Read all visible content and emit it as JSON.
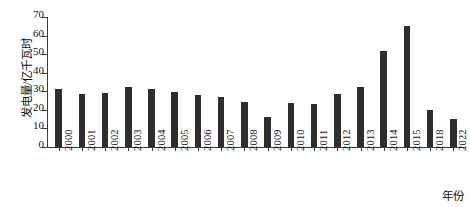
{
  "chart_data": {
    "type": "bar",
    "title": "",
    "xlabel": "年份",
    "ylabel": "发电量/亿千瓦时",
    "ylim": [
      0,
      70
    ],
    "yticks": [
      0,
      10,
      20,
      30,
      40,
      50,
      60,
      70
    ],
    "grid": false,
    "legend": null,
    "bar_color": "#2e2e2e",
    "axis_color": "#3a3a3a",
    "categories": [
      "2000",
      "2001",
      "2002",
      "2003",
      "2004",
      "2005",
      "2006",
      "2007",
      "2008",
      "2009",
      "2010",
      "2011",
      "2012",
      "2013",
      "2014",
      "2015",
      "2018",
      "2022"
    ],
    "values": [
      31.5,
      28.5,
      29.0,
      32.5,
      31.0,
      29.5,
      28.0,
      27.0,
      24.5,
      16.0,
      23.5,
      23.0,
      28.5,
      32.5,
      51.5,
      65.0,
      20.0,
      15.0
    ]
  }
}
